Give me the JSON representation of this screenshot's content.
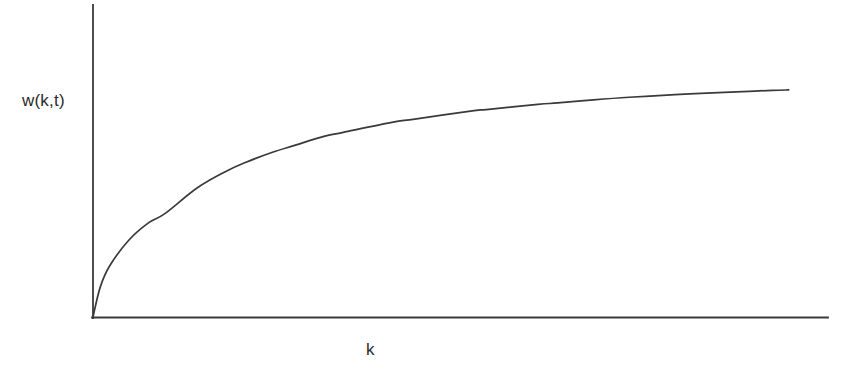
{
  "chart_data": {
    "type": "line",
    "title": "",
    "subtitle": "",
    "xlabel": "k",
    "ylabel": "w(k,t)",
    "legend": [],
    "legend_position": "none",
    "grid": false,
    "x_tick_labels": [],
    "y_tick_labels": [],
    "xlim": [
      0,
      10
    ],
    "ylim": [
      0,
      1.08
    ],
    "annotations": [],
    "series": [
      {
        "name": "w(k,t)",
        "color": "#3a3a3a",
        "line_width": 1.7,
        "x": [
          0.0,
          0.1,
          0.23,
          0.5,
          0.78,
          1.0,
          1.46,
          1.87,
          2.14,
          2.5,
          2.82,
          3.23,
          3.5,
          4.18,
          4.5,
          5.33,
          5.5,
          6.22,
          6.5,
          7.0,
          7.5,
          8.14,
          8.5,
          9.0,
          9.5,
          9.73
        ],
        "y": [
          0.0,
          0.125,
          0.214,
          0.324,
          0.398,
          0.435,
          0.545,
          0.616,
          0.653,
          0.694,
          0.724,
          0.762,
          0.779,
          0.821,
          0.835,
          0.871,
          0.875,
          0.897,
          0.903,
          0.916,
          0.927,
          0.938,
          0.943,
          0.95,
          0.956,
          0.958
        ]
      }
    ],
    "axes": {
      "x_axis_visible": true,
      "y_axis_visible": true,
      "x_axis_color": "#3a3a3a",
      "y_axis_color": "#3a3a3a",
      "axis_line_width": 1.8,
      "ticks_visible": false,
      "spine_style": "L-shaped open axes"
    },
    "colors": {
      "background": "#ffffff",
      "line": "#3a3a3a",
      "text": "#2b2b2b"
    },
    "geometry": {
      "origin_x": 93,
      "origin_y": 317,
      "y_axis_top": 5,
      "x_axis_right": 828,
      "curve_end_x": 808,
      "curve_end_y": 79
    }
  }
}
